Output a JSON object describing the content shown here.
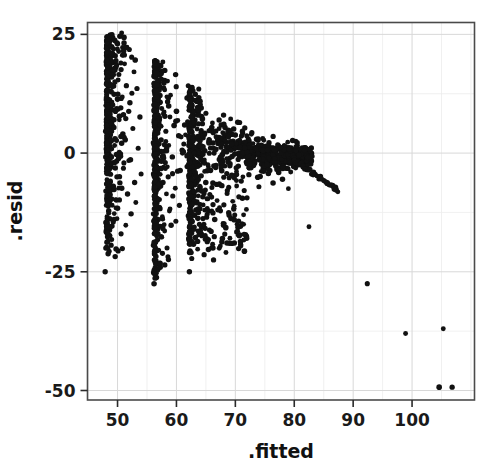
{
  "chart_data": {
    "type": "scatter",
    "title": "",
    "xlabel": ".fitted",
    "ylabel": ".resid",
    "xlim": [
      44.9,
      110.6
    ],
    "ylim": [
      -52.0,
      27.5
    ],
    "grid": true,
    "legend": "none",
    "x_ticks": [
      50,
      60,
      70,
      80,
      90,
      100
    ],
    "x_tick_labels": [
      "50",
      "60",
      "70",
      "80",
      "90",
      "100"
    ],
    "y_ticks": [
      25,
      0,
      -25,
      -50
    ],
    "y_tick_labels": [
      "25",
      "0",
      "-25",
      "-50"
    ],
    "x_minor_step": 5,
    "y_minor_step": 12.5,
    "point_color": "#111111",
    "point_radius": 2.6,
    "panel_border_color": "#4a4a4a",
    "grid_color": "#d8d8d8",
    "grid_minor_color": "#ececec",
    "background": "#ffffff",
    "n_points": 1540,
    "points": [
      [
        47.9,
        -25.0
      ],
      [
        92.4,
        -27.5
      ],
      [
        98.9,
        -38.0
      ],
      [
        105.3,
        -37.0
      ],
      [
        104.6,
        -49.3
      ],
      [
        106.8,
        -49.3
      ],
      [
        71.2,
        -9.5
      ],
      [
        71.4,
        -15.0
      ],
      [
        82.5,
        -15.5
      ],
      [
        66.3,
        -22.5
      ],
      [
        62.2,
        -25.0
      ],
      [
        56.2,
        -27.5
      ],
      [
        50.7,
        25.3
      ],
      [
        50.4,
        24.6
      ],
      [
        51.1,
        23.2
      ],
      [
        50.0,
        23.0
      ],
      [
        51.6,
        22.3
      ],
      [
        52.0,
        21.8
      ],
      [
        50.2,
        21.4
      ],
      [
        49.6,
        20.5
      ],
      [
        52.4,
        20.2
      ],
      [
        53.0,
        19.6
      ],
      [
        49.2,
        19.1
      ],
      [
        51.2,
        18.8
      ],
      [
        48.6,
        18.2
      ],
      [
        50.6,
        17.6
      ],
      [
        52.8,
        17.1
      ],
      [
        48.4,
        16.5
      ],
      [
        49.0,
        16.0
      ],
      [
        50.1,
        15.4
      ],
      [
        48.2,
        14.8
      ],
      [
        51.5,
        14.2
      ],
      [
        53.3,
        13.6
      ],
      [
        48.1,
        13.0
      ],
      [
        49.4,
        12.4
      ],
      [
        50.8,
        11.8
      ],
      [
        48.3,
        11.2
      ],
      [
        52.1,
        10.6
      ],
      [
        48.0,
        10.0
      ],
      [
        49.8,
        9.4
      ],
      [
        51.9,
        8.8
      ],
      [
        48.5,
        8.2
      ],
      [
        53.8,
        7.6
      ],
      [
        50.3,
        7.0
      ],
      [
        48.2,
        6.4
      ],
      [
        49.1,
        5.8
      ],
      [
        52.6,
        5.2
      ],
      [
        48.0,
        4.6
      ],
      [
        50.9,
        4.0
      ],
      [
        48.7,
        3.4
      ],
      [
        51.3,
        2.8
      ],
      [
        48.1,
        2.2
      ],
      [
        49.5,
        1.6
      ],
      [
        53.5,
        1.0
      ],
      [
        48.3,
        0.4
      ],
      [
        50.5,
        -0.2
      ],
      [
        48.0,
        -0.8
      ],
      [
        52.2,
        -1.4
      ],
      [
        49.3,
        -2.0
      ],
      [
        48.4,
        -2.6
      ],
      [
        51.0,
        -3.2
      ],
      [
        48.1,
        -3.8
      ],
      [
        54.0,
        -4.4
      ],
      [
        49.9,
        -5.0
      ],
      [
        48.2,
        -5.6
      ],
      [
        52.9,
        -6.2
      ],
      [
        48.6,
        -6.8
      ],
      [
        50.2,
        -7.4
      ],
      [
        48.0,
        -8.0
      ],
      [
        51.7,
        -8.6
      ],
      [
        48.3,
        -9.2
      ],
      [
        49.7,
        -9.8
      ],
      [
        53.1,
        -10.4
      ],
      [
        48.1,
        -11.0
      ],
      [
        50.0,
        -11.6
      ],
      [
        48.5,
        -12.2
      ],
      [
        52.3,
        -12.8
      ],
      [
        48.2,
        -13.4
      ],
      [
        49.4,
        -14.0
      ],
      [
        48.0,
        -14.6
      ],
      [
        51.4,
        -15.2
      ],
      [
        48.7,
        -15.8
      ],
      [
        48.1,
        -16.4
      ],
      [
        50.6,
        -17.0
      ],
      [
        48.3,
        -17.6
      ],
      [
        49.0,
        -18.2
      ],
      [
        48.2,
        -18.8
      ],
      [
        48.9,
        -19.4
      ],
      [
        48.0,
        -20.0
      ],
      [
        50.1,
        -20.6
      ],
      [
        48.4,
        -21.2
      ],
      [
        49.6,
        -21.8
      ],
      [
        56.4,
        19.5
      ],
      [
        56.8,
        18.4
      ],
      [
        57.2,
        17.2
      ],
      [
        56.2,
        16.2
      ],
      [
        58.0,
        15.3
      ],
      [
        56.6,
        14.5
      ],
      [
        57.8,
        13.7
      ],
      [
        56.3,
        12.9
      ],
      [
        59.0,
        12.2
      ],
      [
        56.9,
        11.5
      ],
      [
        58.5,
        10.8
      ],
      [
        56.1,
        10.1
      ],
      [
        57.5,
        9.4
      ],
      [
        60.0,
        8.8
      ],
      [
        56.5,
        8.2
      ],
      [
        58.9,
        7.6
      ],
      [
        56.2,
        7.0
      ],
      [
        57.0,
        6.4
      ],
      [
        59.6,
        5.8
      ],
      [
        56.7,
        5.2
      ],
      [
        58.2,
        4.6
      ],
      [
        56.3,
        4.0
      ],
      [
        60.8,
        3.4
      ],
      [
        57.4,
        2.8
      ],
      [
        56.1,
        2.2
      ],
      [
        58.7,
        1.6
      ],
      [
        56.6,
        1.0
      ],
      [
        57.9,
        0.4
      ],
      [
        56.2,
        -0.2
      ],
      [
        59.3,
        -0.8
      ],
      [
        56.8,
        -1.4
      ],
      [
        58.1,
        -2.0
      ],
      [
        56.4,
        -2.6
      ],
      [
        57.3,
        -3.2
      ],
      [
        60.2,
        -3.8
      ],
      [
        56.1,
        -4.4
      ],
      [
        58.6,
        -5.0
      ],
      [
        56.9,
        -5.6
      ],
      [
        57.7,
        -6.2
      ],
      [
        56.3,
        -6.8
      ],
      [
        59.8,
        -7.4
      ],
      [
        56.5,
        -8.0
      ],
      [
        58.3,
        -8.6
      ],
      [
        56.2,
        -9.2
      ],
      [
        57.1,
        -9.8
      ],
      [
        56.7,
        -10.4
      ],
      [
        60.5,
        -11.0
      ],
      [
        56.4,
        -11.6
      ],
      [
        58.8,
        -12.2
      ],
      [
        56.1,
        -12.8
      ],
      [
        57.6,
        -13.4
      ],
      [
        56.9,
        -14.0
      ],
      [
        56.3,
        -14.6
      ],
      [
        59.1,
        -15.2
      ],
      [
        56.6,
        -15.8
      ],
      [
        58.0,
        -16.4
      ],
      [
        56.2,
        -17.0
      ],
      [
        57.4,
        -17.6
      ],
      [
        56.8,
        -18.2
      ],
      [
        56.4,
        -18.8
      ],
      [
        56.1,
        -19.4
      ],
      [
        58.4,
        -20.0
      ],
      [
        56.7,
        -20.6
      ],
      [
        56.3,
        -21.2
      ],
      [
        56.5,
        -21.8
      ],
      [
        56.2,
        -22.5
      ],
      [
        56.9,
        -23.4
      ],
      [
        56.4,
        -24.2
      ],
      [
        56.1,
        -25.2
      ],
      [
        56.6,
        -26.2
      ],
      [
        62.0,
        14.2
      ],
      [
        62.6,
        13.2
      ],
      [
        63.2,
        12.4
      ],
      [
        61.8,
        11.6
      ],
      [
        64.0,
        10.9
      ],
      [
        62.3,
        10.2
      ],
      [
        63.6,
        9.6
      ],
      [
        62.1,
        9.0
      ],
      [
        65.0,
        8.4
      ],
      [
        62.8,
        7.8
      ],
      [
        64.4,
        7.2
      ],
      [
        61.9,
        6.6
      ],
      [
        63.0,
        6.0
      ],
      [
        66.0,
        5.4
      ],
      [
        62.4,
        4.8
      ],
      [
        64.8,
        4.2
      ],
      [
        62.0,
        3.6
      ],
      [
        63.4,
        3.0
      ],
      [
        65.5,
        2.4
      ],
      [
        62.7,
        1.8
      ],
      [
        64.1,
        1.2
      ],
      [
        62.2,
        0.6
      ],
      [
        66.4,
        0.0
      ],
      [
        63.8,
        -0.6
      ],
      [
        62.5,
        -1.2
      ],
      [
        64.6,
        -1.8
      ],
      [
        62.0,
        -2.4
      ],
      [
        63.1,
        -3.0
      ],
      [
        65.8,
        -3.6
      ],
      [
        62.9,
        -4.2
      ],
      [
        64.2,
        -4.8
      ],
      [
        62.3,
        -5.4
      ],
      [
        63.5,
        -6.0
      ],
      [
        66.8,
        -6.6
      ],
      [
        62.6,
        -7.2
      ],
      [
        64.9,
        -7.8
      ],
      [
        62.1,
        -8.4
      ],
      [
        63.7,
        -9.0
      ],
      [
        65.2,
        -9.6
      ],
      [
        62.8,
        -10.2
      ],
      [
        64.0,
        -10.8
      ],
      [
        62.4,
        -11.4
      ],
      [
        63.3,
        -12.0
      ],
      [
        66.2,
        -12.6
      ],
      [
        62.0,
        -13.2
      ],
      [
        64.5,
        -13.8
      ],
      [
        62.7,
        -14.4
      ],
      [
        63.9,
        -15.0
      ],
      [
        62.2,
        -15.6
      ],
      [
        65.6,
        -16.2
      ],
      [
        62.5,
        -16.8
      ],
      [
        64.3,
        -17.4
      ],
      [
        62.1,
        -18.0
      ],
      [
        63.6,
        -18.6
      ],
      [
        62.9,
        -19.2
      ],
      [
        66.0,
        -19.9
      ],
      [
        62.3,
        -20.6
      ],
      [
        64.7,
        -21.4
      ],
      [
        62.6,
        -22.2
      ],
      [
        68.0,
        8.0
      ],
      [
        69.2,
        7.2
      ],
      [
        70.4,
        6.5
      ],
      [
        67.6,
        5.9
      ],
      [
        71.6,
        5.3
      ],
      [
        68.8,
        4.8
      ],
      [
        72.8,
        4.3
      ],
      [
        70.0,
        3.8
      ],
      [
        67.2,
        3.3
      ],
      [
        73.6,
        2.9
      ],
      [
        69.6,
        2.5
      ],
      [
        71.2,
        2.1
      ],
      [
        74.4,
        1.7
      ],
      [
        68.4,
        1.3
      ],
      [
        72.0,
        0.9
      ],
      [
        75.2,
        0.5
      ],
      [
        70.8,
        0.1
      ],
      [
        67.8,
        -0.3
      ],
      [
        73.2,
        -0.7
      ],
      [
        69.0,
        -1.1
      ],
      [
        76.0,
        -1.5
      ],
      [
        71.8,
        -1.9
      ],
      [
        74.8,
        -2.3
      ],
      [
        68.2,
        -2.7
      ],
      [
        72.4,
        -3.1
      ],
      [
        77.0,
        -3.5
      ],
      [
        70.2,
        -3.9
      ],
      [
        75.6,
        -4.3
      ],
      [
        69.4,
        -4.7
      ],
      [
        73.8,
        -5.1
      ],
      [
        78.0,
        -5.5
      ],
      [
        71.0,
        -5.9
      ],
      [
        76.4,
        -6.3
      ],
      [
        67.4,
        -6.7
      ],
      [
        74.0,
        -7.1
      ],
      [
        79.0,
        -7.5
      ],
      [
        72.6,
        -2.9
      ],
      [
        77.8,
        -2.2
      ],
      [
        80.2,
        -1.6
      ],
      [
        75.0,
        -2.8
      ],
      [
        78.6,
        -3.2
      ],
      [
        81.0,
        -1.0
      ],
      [
        82.0,
        -0.6
      ],
      [
        80.6,
        -2.4
      ],
      [
        79.4,
        -4.0
      ],
      [
        83.2,
        -4.6
      ],
      [
        84.4,
        -5.4
      ],
      [
        85.6,
        -6.4
      ],
      [
        87.0,
        -7.2
      ],
      [
        68.6,
        -8.5
      ],
      [
        70.6,
        -9.2
      ],
      [
        66.9,
        -10.0
      ],
      [
        69.8,
        -11.2
      ],
      [
        67.0,
        -12.0
      ],
      [
        71.4,
        -13.0
      ],
      [
        66.5,
        -14.0
      ],
      [
        68.0,
        -15.2
      ],
      [
        65.9,
        -16.5
      ],
      [
        67.8,
        -18.0
      ],
      [
        66.2,
        -20.0
      ],
      [
        74.2,
        1.5
      ],
      [
        76.8,
        0.8
      ],
      [
        73.0,
        2.0
      ],
      [
        78.2,
        0.2
      ],
      [
        75.8,
        1.0
      ],
      [
        71.0,
        3.5
      ],
      [
        72.2,
        3.0
      ],
      [
        79.6,
        -0.4
      ],
      [
        81.4,
        -1.8
      ],
      [
        77.2,
        -1.0
      ],
      [
        80.0,
        -2.0
      ],
      [
        74.6,
        0.0
      ],
      [
        73.4,
        1.2
      ],
      [
        76.2,
        -0.8
      ]
    ]
  },
  "axis": {
    "x_title": ".fitted",
    "y_title": ".resid"
  }
}
